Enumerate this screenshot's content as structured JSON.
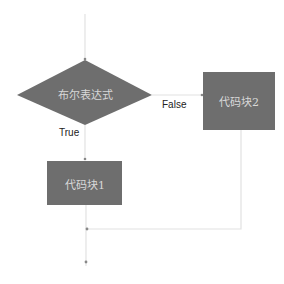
{
  "diagram": {
    "type": "flowchart",
    "colors": {
      "node_fill": "#6e6e6e",
      "node_text": "#d8d8d8",
      "edge": "#e2e2e2",
      "edge_label": "#222222",
      "background": "#ffffff"
    },
    "nodes": [
      {
        "id": "condition",
        "shape": "diamond",
        "label": "布尔表达式"
      },
      {
        "id": "block1",
        "shape": "rect",
        "label": "代码块1"
      },
      {
        "id": "block2",
        "shape": "rect",
        "label": "代码块2"
      }
    ],
    "edges": [
      {
        "from": "start",
        "to": "condition",
        "label": ""
      },
      {
        "from": "condition",
        "to": "block1",
        "label": "True"
      },
      {
        "from": "condition",
        "to": "block2",
        "label": "False"
      },
      {
        "from": "block1",
        "to": "merge",
        "label": ""
      },
      {
        "from": "block2",
        "to": "merge",
        "label": ""
      },
      {
        "from": "merge",
        "to": "end",
        "label": ""
      }
    ],
    "labels": {
      "condition": "布尔表达式",
      "block1": "代码块1",
      "block2": "代码块2",
      "true_branch": "True",
      "false_branch": "False"
    }
  }
}
